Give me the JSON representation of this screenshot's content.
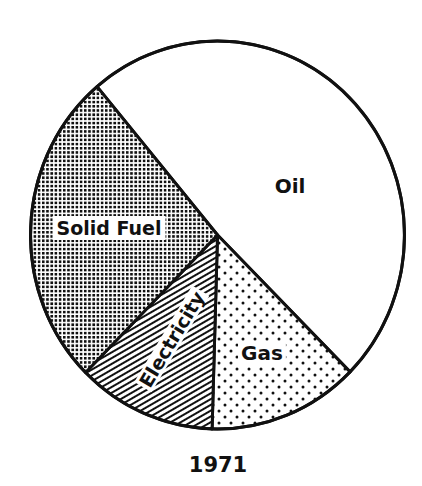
{
  "chart_data": {
    "type": "pie",
    "title": "1971",
    "start_angle_deg": 229.9,
    "direction": "clockwise",
    "categories": [
      "Oil",
      "Gas",
      "Electricity",
      "Solid Fuel"
    ],
    "values": [
      48.6,
      13.0,
      12.0,
      26.4
    ],
    "unit": "percent (estimated from slice angles)",
    "slices": [
      {
        "label": "Oil",
        "value": 48.6,
        "pattern": "blank",
        "fill": "#ffffff"
      },
      {
        "label": "Gas",
        "value": 13.0,
        "pattern": "dots",
        "fill": "#111111"
      },
      {
        "label": "Electricity",
        "value": 12.0,
        "pattern": "diagonal-hatch",
        "fill": "#111111"
      },
      {
        "label": "Solid Fuel",
        "value": 26.4,
        "pattern": "crosshatch-dense",
        "fill": "#111111"
      }
    ],
    "legend": "none (labels inside slices)"
  },
  "geometry": {
    "cx": 217.5,
    "cy": 235,
    "rx": 187,
    "ry": 194,
    "stroke": "#111111",
    "stroke_width": 3
  },
  "labels": {
    "oil": {
      "text": "Oil",
      "x": 290,
      "y": 193,
      "size": 20,
      "rotate": 0
    },
    "gas": {
      "text": "Gas",
      "x": 262,
      "y": 360,
      "size": 20,
      "rotate": 0
    },
    "electricity": {
      "text": "Electricity",
      "x": 172,
      "y": 346,
      "size": 19,
      "rotate": -59
    },
    "solid_fuel": {
      "text": "Solid Fuel",
      "x": 109,
      "y": 235,
      "size": 19,
      "rotate": 0
    }
  },
  "title": {
    "text": "1971",
    "x": 218,
    "y": 472,
    "size": 21
  }
}
